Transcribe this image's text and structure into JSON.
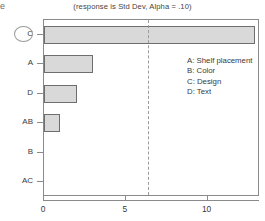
{
  "chart_data": {
    "type": "bar",
    "orientation": "horizontal",
    "title": "(response is Std Dev, Alpha = .10)",
    "xlabel": "",
    "ylabel": "",
    "categories": [
      "C",
      "A",
      "D",
      "AB",
      "B",
      "AC"
    ],
    "values": [
      12.9,
      3.0,
      2.0,
      1.0,
      0.0,
      0.0
    ],
    "xlim": [
      0,
      13.2
    ],
    "xticks": [
      0,
      5,
      10
    ],
    "xtick_labels": [
      "0",
      "5",
      "10"
    ],
    "grid": false,
    "reference_line": {
      "value": 6.35,
      "style": "dashed",
      "color": "#9a9a9a"
    },
    "highlighted_category": "C",
    "bar_fill": "#d9d9d9",
    "bar_stroke": "#6e6e6e",
    "legend_position": "inside-right",
    "legend": [
      {
        "key": "A",
        "label": "A: Shelf placement"
      },
      {
        "key": "B",
        "label": "B: Color"
      },
      {
        "key": "C",
        "label": "C: Design"
      },
      {
        "key": "D",
        "label": "D: Text"
      }
    ]
  },
  "artifact": {
    "corner_glyph": "e"
  }
}
